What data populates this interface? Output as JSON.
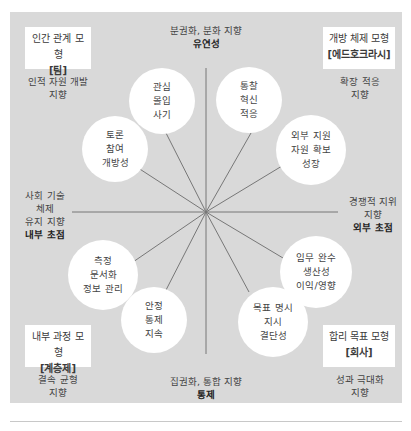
{
  "colors": {
    "panel": "#d9d9d9",
    "box": "#ffffff",
    "line": "#777777",
    "text": "#3a3a3a"
  },
  "axes": {
    "top": {
      "line1": "분권화, 분화 지향",
      "line2": "유연성"
    },
    "bottom": {
      "line1": "집권화, 통합 지향",
      "line2": "통제"
    },
    "left": {
      "line1": "사회 기술",
      "line2": "체제",
      "line3": "유지 지향",
      "line4": "내부 초점"
    },
    "right": {
      "line1": "경쟁적 지위",
      "line2": "지향",
      "line3": "외부 초점"
    }
  },
  "models": {
    "top_left": {
      "title": "인간 관계 모형",
      "type": "[팀]",
      "orientation_line1": "인적 자원 개발",
      "orientation_line2": "지향"
    },
    "top_right": {
      "title": "개방 체제 모형",
      "type": "[에드호크라시]",
      "orientation_line1": "확장 적응",
      "orientation_line2": "지향"
    },
    "bottom_left": {
      "title": "내부 과정 모형",
      "type": "[계층제]",
      "orientation_line1": "결속 균형",
      "orientation_line2": "지향"
    },
    "bottom_right": {
      "title": "합리 목표 모형",
      "type": "[회사]",
      "orientation_line1": "성과 극대화",
      "orientation_line2": "지향"
    }
  },
  "circles": [
    {
      "id": "concern",
      "lines": [
        "관심",
        "몰입",
        "사기"
      ]
    },
    {
      "id": "discussion",
      "lines": [
        "토론",
        "참여",
        "개방성"
      ]
    },
    {
      "id": "insight",
      "lines": [
        "통찰",
        "혁신",
        "적응"
      ]
    },
    {
      "id": "external-support",
      "lines": [
        "외부 지원",
        "자원 확보",
        "성장"
      ]
    },
    {
      "id": "measurement",
      "lines": [
        "측정",
        "문서화",
        "정보 관리"
      ]
    },
    {
      "id": "stability",
      "lines": [
        "안정",
        "통제",
        "지속"
      ]
    },
    {
      "id": "goal",
      "lines": [
        "목표 명시",
        "지시",
        "결단성"
      ]
    },
    {
      "id": "task",
      "lines": [
        "임무 완수",
        "생산성",
        "이익/영향"
      ]
    }
  ]
}
